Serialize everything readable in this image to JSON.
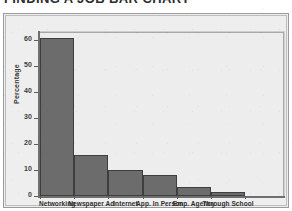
{
  "chart_data": {
    "type": "bar",
    "title": "FINDING A JOB BAR CHART",
    "xlabel": "",
    "ylabel": "Percentage",
    "categories": [
      "Networking",
      "Newspaper Ad",
      "Internet",
      "App. In Person",
      "Emp. Agency",
      "Through School"
    ],
    "values": [
      61,
      16,
      10,
      8,
      3.5,
      1.5
    ],
    "ylim": [
      0,
      63
    ],
    "yticks": [
      0,
      10,
      20,
      30,
      40,
      50,
      60
    ],
    "ytick_labels": [
      "0",
      "10",
      "20",
      "30",
      "40",
      "50",
      "60"
    ],
    "grid": false,
    "legend": false,
    "bar_color": "#6c6c6c",
    "bar_edge_color": "#3e3e3e",
    "plot_background": "#ededed",
    "panel_background": "#eeeeee",
    "axis_color": "#6f6f6f",
    "text_color": "#2f2f2f"
  }
}
